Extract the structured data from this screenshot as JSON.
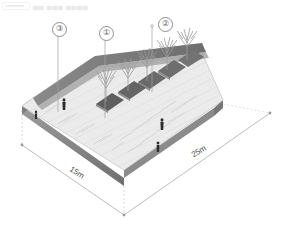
{
  "header": {
    "box_icon": "window-chrome-fragment",
    "glyph_text": "▄▄ ▄▄▄ ▄▄▄▄"
  },
  "drawing": {
    "type": "axonometric-site-plan",
    "subject": "urban plaza with tree planting beds",
    "background_color": "#ffffff",
    "palette": {
      "paving_light": "#ececec",
      "paving_mid": "#dcdcdc",
      "slab_edge_dark": "#8f8f8f",
      "slab_edge_darker": "#6f6f6f",
      "wall_band": "#7e7e7e",
      "wall_band_light": "#c9c9c9",
      "planter_dark": "#6b6b6b",
      "tree_grey": "#9a9a9a",
      "figure_dark": "#2b2b2b",
      "line_grey": "#9b9b9b",
      "marker_text": "#5e5e5e",
      "dimension_text": "#4a4a4a"
    }
  },
  "callouts": [
    {
      "id": "callout-3",
      "label": "③",
      "marker_x": 52,
      "marker_y": 22,
      "leader_x": 58,
      "leader_top": 31,
      "leader_bottom": 112
    },
    {
      "id": "callout-1",
      "label": "①",
      "marker_x": 99,
      "marker_y": 26,
      "leader_x": 105,
      "leader_top": 35,
      "leader_bottom": 118
    },
    {
      "id": "callout-2",
      "label": "②",
      "marker_x": 158,
      "marker_y": 17,
      "leader_x": 152,
      "leader_top": 26,
      "leader_bottom": 92
    }
  ],
  "dimensions": [
    {
      "id": "dimension-15m",
      "label": "15m",
      "x": 72,
      "y": 164,
      "rotate": 33
    },
    {
      "id": "dimension-25m",
      "label": "25m",
      "x": 189,
      "y": 152,
      "rotate": -31
    }
  ],
  "figures": [
    {
      "id": "person-1",
      "x": 64,
      "y": 104
    },
    {
      "id": "person-2",
      "x": 162,
      "y": 124
    },
    {
      "id": "person-3",
      "x": 158,
      "y": 147
    },
    {
      "id": "person-4",
      "x": 36,
      "y": 116
    }
  ],
  "trees": [
    {
      "id": "tree-1",
      "x": 106,
      "y": 96
    },
    {
      "id": "tree-2",
      "x": 128,
      "y": 85
    },
    {
      "id": "tree-3",
      "x": 147,
      "y": 76
    },
    {
      "id": "tree-4",
      "x": 166,
      "y": 66
    },
    {
      "id": "tree-5",
      "x": 186,
      "y": 57
    }
  ]
}
